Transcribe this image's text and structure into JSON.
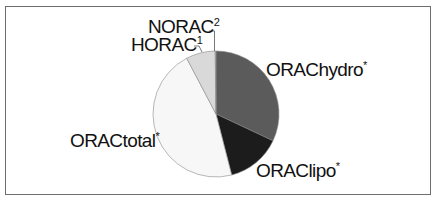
{
  "chart_data": {
    "type": "pie",
    "title": "",
    "start_angle_deg": 0,
    "direction": "clockwise",
    "slices": [
      {
        "label": "ORAChydro*",
        "value": 32.0,
        "color": "#5b5b5b"
      },
      {
        "label": "ORAClipo*",
        "value": 14.0,
        "color": "#1c1c1c"
      },
      {
        "label": "ORACtotal*",
        "value": 46.3,
        "color": "#f7f7f7"
      },
      {
        "label": "HORAC¹",
        "value": 7.5,
        "color": "#d9d9d9"
      },
      {
        "label": "NORAC²",
        "value": 0.2,
        "color": "#bdbdbd"
      }
    ],
    "categories": [
      "ORAChydro*",
      "ORAClipo*",
      "ORACtotal*",
      "HORAC¹",
      "NORAC²"
    ],
    "values": [
      32.0,
      14.0,
      46.3,
      7.5,
      0.2
    ],
    "legend": "none (direct labels)"
  },
  "labels": {
    "hydro": {
      "text": "ORAChydro",
      "sup": "*"
    },
    "lipo": {
      "text": "ORAClipo",
      "sup": "*"
    },
    "total": {
      "text": "ORACtotal",
      "sup": "*"
    },
    "horac": {
      "text": "HORAC",
      "sup": "1"
    },
    "norac": {
      "text": "NORAC",
      "sup": "2"
    }
  }
}
